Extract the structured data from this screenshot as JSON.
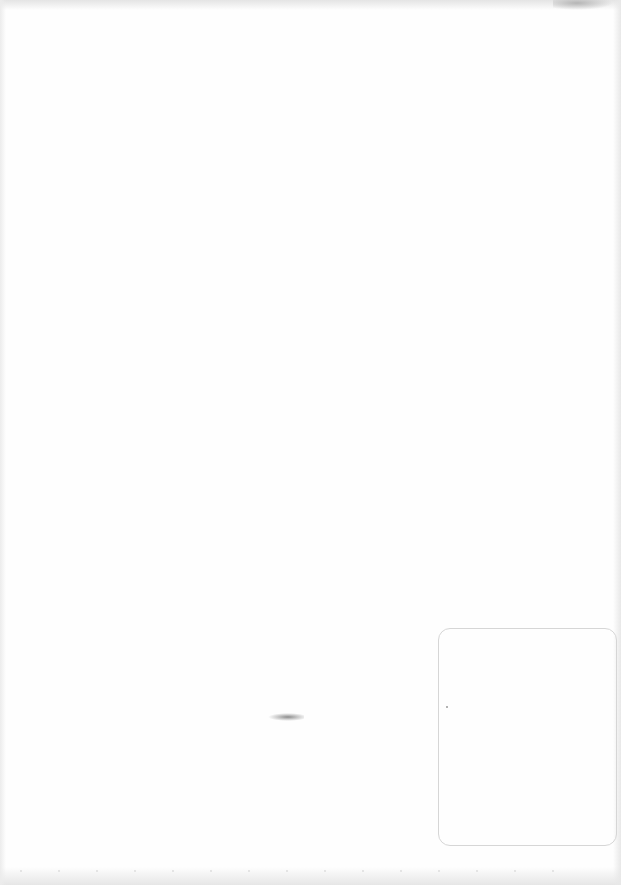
{
  "document": {
    "type": "blank scanned page",
    "text_content": []
  },
  "elements": {
    "box": {
      "shape": "rounded-rectangle",
      "content": ""
    }
  },
  "colors": {
    "paper": "#fefefe",
    "box_border": "#d6d6d6",
    "edge_shadow": "#e4e4e4"
  }
}
